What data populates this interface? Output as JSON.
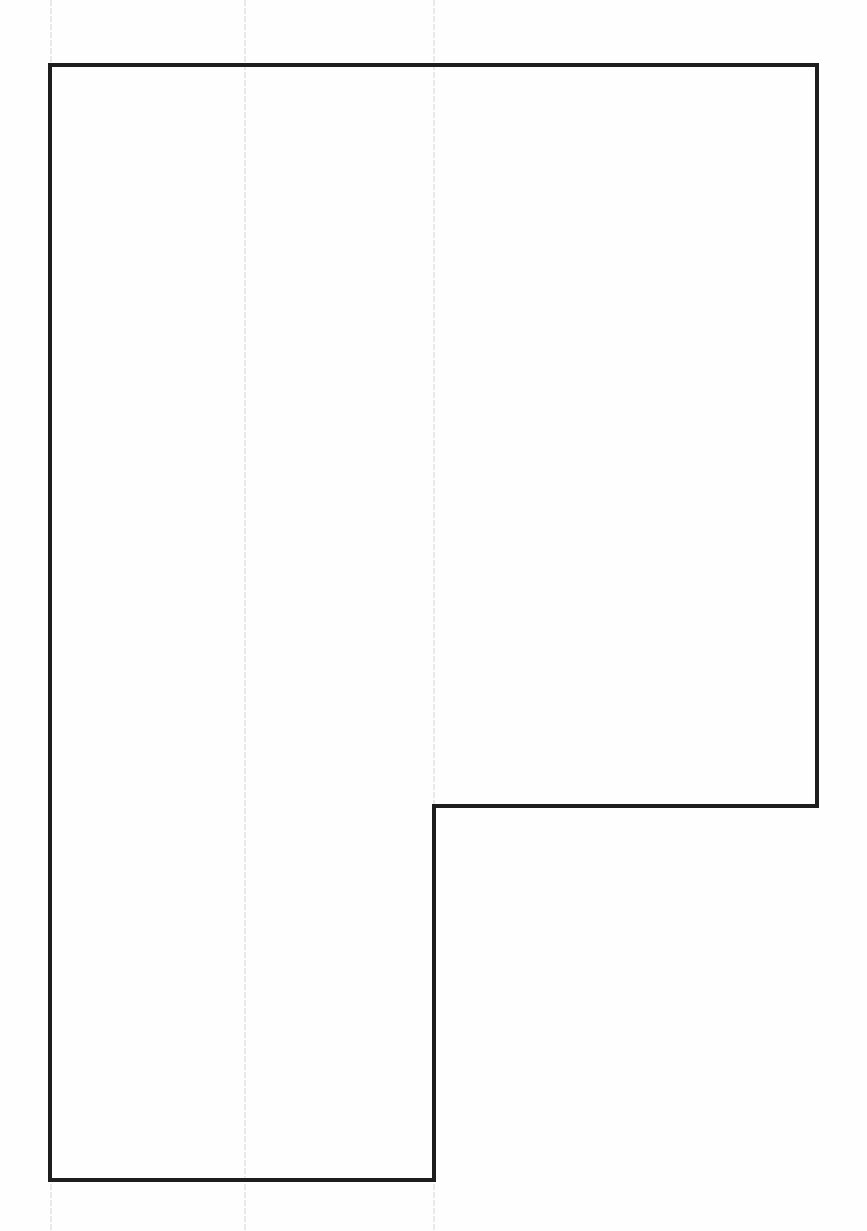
{
  "diagram": {
    "type": "l-shaped-polygon-outline",
    "canvas": {
      "width": 867,
      "height": 1231,
      "background": "#fefefe"
    },
    "outline": {
      "stroke": "#1e1e1e",
      "stroke_width": 4,
      "points": [
        [
          50,
          65
        ],
        [
          817,
          65
        ],
        [
          817,
          806
        ],
        [
          434,
          806
        ],
        [
          434,
          1180
        ],
        [
          50,
          1180
        ]
      ]
    },
    "guide_lines": {
      "stroke": "#d4d4d4",
      "x_positions": [
        51,
        245,
        434
      ]
    }
  }
}
